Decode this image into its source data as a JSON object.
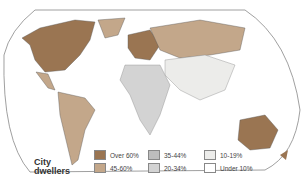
{
  "map": {
    "title": "City dwellers",
    "title_line1": "City",
    "title_line2": "dwellers",
    "projection": "world-interrupted-oval",
    "legend": [
      {
        "label": "Over 60%",
        "color": "#9a7552"
      },
      {
        "label": "45-60%",
        "color": "#c3a78a"
      },
      {
        "label": "35-44%",
        "color": "#bdbdbd"
      },
      {
        "label": "20-34%",
        "color": "#d3d3d3"
      },
      {
        "label": "10-19%",
        "color": "#ececea"
      },
      {
        "label": "Under 10%",
        "color": "#ffffff"
      }
    ],
    "regions": [
      {
        "name": "North America",
        "category": "Over 60%"
      },
      {
        "name": "Greenland",
        "category": "45-60%"
      },
      {
        "name": "Central America",
        "category": "45-60%"
      },
      {
        "name": "South America",
        "category": "45-60%"
      },
      {
        "name": "Europe",
        "category": "Over 60%"
      },
      {
        "name": "USSR",
        "category": "45-60%"
      },
      {
        "name": "China",
        "category": "10-19%"
      },
      {
        "name": "Africa",
        "category": "20-34%"
      },
      {
        "name": "Australia",
        "category": "Over 60%"
      }
    ]
  }
}
